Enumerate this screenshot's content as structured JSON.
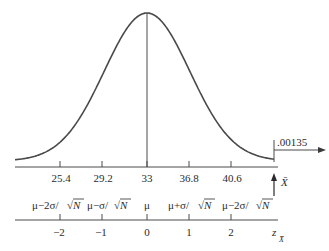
{
  "chart_data": {
    "type": "area",
    "title": "",
    "distribution": {
      "mean": 33,
      "standard_error": 3.8
    },
    "xlabel": "X̄",
    "z_label": "z",
    "z_subscript": "X̄",
    "x_ticks": [
      25.4,
      29.2,
      33,
      36.8,
      40.6
    ],
    "x_tick_labels": [
      "25.4",
      "29.2",
      "33",
      "36.8",
      "40.6"
    ],
    "symbolic_labels": [
      {
        "prefix": "μ−2σ/",
        "radical": "N"
      },
      {
        "prefix": "μ−σ/",
        "radical": "N"
      },
      {
        "prefix": "μ",
        "radical": ""
      },
      {
        "prefix": "μ+σ/",
        "radical": "N"
      },
      {
        "prefix": "μ−2σ/",
        "radical": "N"
      }
    ],
    "z_ticks": [
      -2,
      -1,
      0,
      1,
      2
    ],
    "z_tick_labels": [
      "−2",
      "−1",
      "0",
      "1",
      "2"
    ],
    "annotations": [
      {
        "text": ".00135",
        "target": "right tail area beyond z = 3"
      }
    ],
    "grid": false,
    "legend": null
  }
}
